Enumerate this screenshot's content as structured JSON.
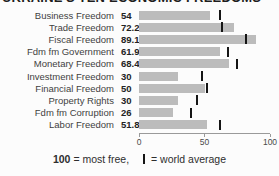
{
  "title": "UKRAINE'S TEN ECONOMIC FREEDOMS",
  "chart_data": {
    "type": "bar",
    "orientation": "horizontal",
    "title": "UKRAINE'S TEN ECONOMIC FREEDOMS",
    "categories": [
      "Business Freedom",
      "Trade Freedom",
      "Fiscal Freedom",
      "Fdm fm Government",
      "Monetary Freedom",
      "Investment Freedom",
      "Financial Freedom",
      "Property Rights",
      "Fdm fm Corruption",
      "Labor Freedom"
    ],
    "values": [
      54,
      72.2,
      89.1,
      61.9,
      68.4,
      30,
      50,
      30,
      26,
      51.8
    ],
    "value_labels": [
      "54",
      "72.2",
      "89.1",
      "61.9",
      "68.4",
      "30",
      "50",
      "30",
      "26",
      "51.8"
    ],
    "world_averages": [
      62,
      63.5,
      82,
      68,
      75,
      48,
      52,
      44,
      40,
      62
    ],
    "xlim": [
      0,
      100
    ],
    "x_ticks": [
      "0",
      "50",
      "100"
    ],
    "x_tick_values": [
      0,
      50,
      100
    ],
    "bar_color": "#bcbcbc",
    "marker_color": "#151515",
    "grid": false,
    "legend_note": "100 = most free, | = world average"
  },
  "footer": {
    "bold": "100",
    "after_bold": " = most free,",
    "marker_label": "= world average"
  }
}
